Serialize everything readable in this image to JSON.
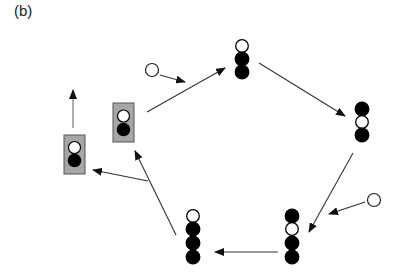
{
  "figure": {
    "panel_label": "(b)",
    "colors": {
      "line": "#333333",
      "filled_ball": "#000000",
      "empty_ball": "#ffffff",
      "box_fill": "#a6a6a6",
      "box_stroke": "#555555"
    },
    "stacks": [
      {
        "name": "top-stack",
        "x": 242,
        "balls": [
          "white",
          "black",
          "black"
        ],
        "y_start": 46
      },
      {
        "name": "right-stack",
        "x": 362,
        "balls": [
          "black",
          "white",
          "black"
        ],
        "y_start": 109
      },
      {
        "name": "bottom-right-stack",
        "x": 292,
        "balls": [
          "black",
          "white",
          "black",
          "black"
        ],
        "y_start": 216
      },
      {
        "name": "bottom-left-stack",
        "x": 193,
        "balls": [
          "white",
          "black",
          "black",
          "black"
        ],
        "y_start": 216
      }
    ],
    "boxes": [
      {
        "name": "middle-box",
        "x": 113,
        "y": 103,
        "w": 21,
        "h": 39,
        "balls": [
          "white",
          "black"
        ]
      },
      {
        "name": "left-box",
        "x": 64,
        "y": 135,
        "w": 21,
        "h": 39,
        "balls": [
          "white",
          "black"
        ]
      }
    ],
    "free_balls": [
      {
        "name": "incoming-ball-top",
        "x": 153,
        "y": 70
      },
      {
        "name": "incoming-ball-right",
        "x": 374,
        "y": 200
      }
    ]
  }
}
